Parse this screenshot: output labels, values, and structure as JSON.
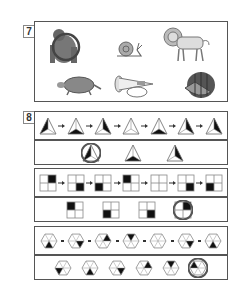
{
  "question7": {
    "number": "7",
    "items": [
      {
        "name": "gorilla",
        "selected": true
      },
      {
        "name": "snail",
        "selected": false
      },
      {
        "name": "lion",
        "selected": false
      },
      {
        "name": "turtle",
        "selected": false
      },
      {
        "name": "horn",
        "selected": false
      },
      {
        "name": "watermelon",
        "selected": false
      }
    ]
  },
  "question8": {
    "number": "8",
    "triangle_set": {
      "sequence": [
        "left",
        "bottom",
        "right",
        "none",
        "bottom",
        "right",
        "right"
      ],
      "options": [
        {
          "shaded": "left",
          "selected": true
        },
        {
          "shaded": "bottom",
          "selected": false
        },
        {
          "shaded": "right",
          "selected": false
        }
      ]
    },
    "grid_set": {
      "sequence": [
        "tr",
        "br",
        "bl",
        "tl",
        "none",
        "br",
        "bl"
      ],
      "options": [
        {
          "shaded": "tl",
          "selected": false
        },
        {
          "shaded": "bl",
          "selected": false
        },
        {
          "shaded": "br",
          "selected": false
        },
        {
          "shaded": "tr",
          "selected": true
        }
      ]
    },
    "hexagon_set": {
      "sequence": [
        3,
        2,
        1,
        0,
        -1,
        2,
        3
      ],
      "options": [
        {
          "shaded": 4,
          "selected": false
        },
        {
          "shaded": 3,
          "selected": false
        },
        {
          "shaded": 2,
          "selected": false
        },
        {
          "shaded": 1,
          "selected": false
        },
        {
          "shaded": 0,
          "selected": false
        },
        {
          "shaded": 5,
          "selected": true
        }
      ]
    }
  }
}
